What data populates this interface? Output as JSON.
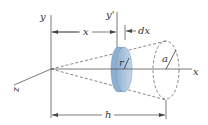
{
  "figure": {
    "labels": {
      "y_axis": "y",
      "y_prime_axis": "y'",
      "x_axis": "x",
      "z_axis": "z",
      "x_distance": "x",
      "dx": "dx",
      "disk_radius": "r",
      "base_radius": "a",
      "height": "h"
    },
    "colors": {
      "disk_fill": "#a9c6e0",
      "disk_edge": "#7fa3c4",
      "lines": "#555555"
    }
  }
}
